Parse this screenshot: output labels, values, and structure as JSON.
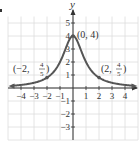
{
  "chart_data": {
    "type": "line",
    "title": "",
    "function": "y = 4/(x^2+1)",
    "xlabel": "",
    "ylabel": "y",
    "xlim": [
      -5,
      5
    ],
    "ylim": [
      -4,
      5.5
    ],
    "grid": true,
    "x_ticks": [
      "-4",
      "-3",
      "-2",
      "-1",
      "1",
      "2",
      "3",
      "4"
    ],
    "x_tick_values": [
      -4,
      -3,
      -2,
      -1,
      1,
      2,
      3,
      4
    ],
    "y_ticks": [
      "5",
      "4",
      "3",
      "2",
      "1",
      "-1",
      "-2",
      "-3"
    ],
    "y_tick_values": [
      5,
      4,
      3,
      2,
      1,
      -1,
      -2,
      -3
    ],
    "series": [
      {
        "name": "f(x)",
        "x": [
          -4.7,
          -4,
          -3,
          -2,
          -1,
          0,
          1,
          2,
          3,
          4,
          4.7
        ],
        "y": [
          0.17,
          0.24,
          0.4,
          0.8,
          2,
          4,
          2,
          0.8,
          0.4,
          0.24,
          0.17
        ]
      }
    ],
    "annotations": [
      {
        "text": "(0, 4)",
        "x": 0,
        "y": 4
      },
      {
        "text": "(-2, 4/5)",
        "x": -2,
        "y": 0.8
      },
      {
        "text": "(2, 4/5)",
        "x": 2,
        "y": 0.8
      }
    ]
  },
  "labels": {
    "y_axis": "y",
    "peak": "(0, 4)",
    "left_point_prefix": "(−2,",
    "right_point_prefix": "(2,",
    "frac_num": "4",
    "frac_den": "5",
    "close_paren": ")"
  },
  "colors": {
    "curve": "#555555",
    "axis": "#333333",
    "grid": "#dddddd"
  }
}
